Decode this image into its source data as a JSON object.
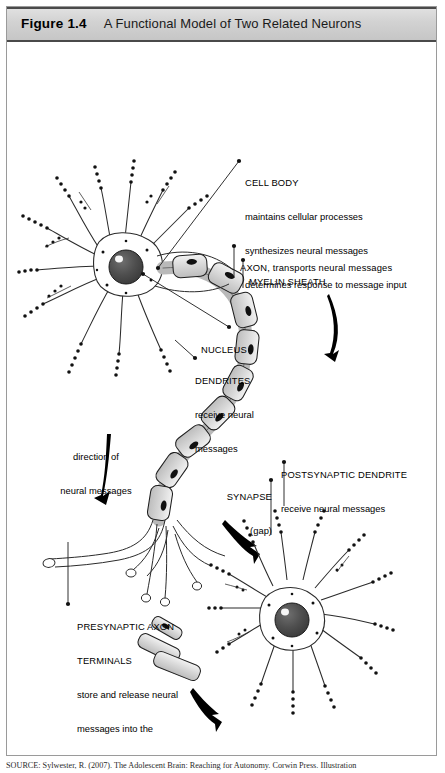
{
  "figure": {
    "number": "Figure 1.4",
    "title": "A Functional Model of Two Related Neurons"
  },
  "labels": {
    "cell_body": {
      "heading": "CELL BODY",
      "line1": "maintains cellular processes",
      "line2": "synthesizes neural messages",
      "line3": "determines response to message input"
    },
    "axon": {
      "heading": "AXON, transports neural messages"
    },
    "myelin": {
      "heading": "MYELIN SHEATH"
    },
    "nucleus": {
      "heading": "NUCLEUS"
    },
    "dendrites": {
      "heading": "DENDRITES",
      "line1": "receive neural",
      "line2": "messages"
    },
    "direction": {
      "line1": "direction of",
      "line2": "neural messages"
    },
    "synapse": {
      "heading": "SYNAPSE",
      "line1": "(gap)"
    },
    "postsynaptic": {
      "heading": "POSTSYNAPTIC DENDRITE",
      "line1": "receive neural messages"
    },
    "presynaptic": {
      "heading1": "PRESYNAPTIC AXON",
      "heading2": "TERMINALS",
      "line1": "store and release neural",
      "line2": "messages into the",
      "line3": "synapse"
    }
  },
  "source": {
    "text": "SOURCE: Sylwester, R. (2007). The Adolescent Brain: Reaching for Autonomy. Corwin Press. Illustration"
  },
  "colors": {
    "header_bg": "#d2d2d2",
    "header_border": "#4a4a4a",
    "frame_border": "#9a9a9a",
    "nucleus_fill": "#4d4d4d",
    "myelin_fill": "#d8d8d8",
    "axon_fill": "#ededed",
    "ink": "#000000"
  }
}
